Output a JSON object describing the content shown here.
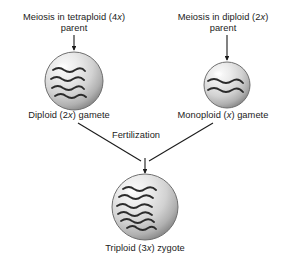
{
  "figure": {
    "background_color": "#ffffff",
    "text_color": "#1b1b1b",
    "cell_fill_light": "#f3f3f3",
    "cell_fill_mid": "#c9c9c9",
    "cell_fill_dark": "#8d8d8d",
    "cell_stroke": "#6e6e6e",
    "chromosome_color": "#2a2a2a",
    "arrow_color": "#1b1b1b"
  },
  "labels": {
    "tetraploid_parent_line1": "Meiosis in tetraploid (4",
    "tetraploid_parent_italic": "x",
    "tetraploid_parent_line1_end": ")",
    "tetraploid_parent_line2": "parent",
    "diploid_parent_line1": "Meiosis in diploid (2",
    "diploid_parent_italic": "x",
    "diploid_parent_line1_end": ")",
    "diploid_parent_line2": "parent",
    "diploid_gamete_pre": "Diploid (2",
    "diploid_gamete_italic": "x",
    "diploid_gamete_post": ") gamete",
    "monoploid_gamete_pre": "Monoploid (",
    "monoploid_gamete_italic": "x",
    "monoploid_gamete_post": ") gamete",
    "fertilization": "Fertilization",
    "triploid_zygote_pre": "Triploid (3",
    "triploid_zygote_italic": "x",
    "triploid_zygote_post": ") zygote"
  },
  "cells": [
    {
      "name": "diploid-gamete-cell",
      "cx": 74,
      "cy": 81,
      "r": 29,
      "chromosome_count": 4,
      "ploidy": "2x"
    },
    {
      "name": "monoploid-gamete-cell",
      "cx": 227,
      "cy": 85,
      "r": 23,
      "chromosome_count": 2,
      "ploidy": "x"
    },
    {
      "name": "triploid-zygote-cell",
      "cx": 145,
      "cy": 207,
      "r": 33,
      "chromosome_count": 6,
      "ploidy": "3x"
    }
  ],
  "arrows": [
    {
      "name": "meiosis-arrow-tetraploid",
      "x1": 74,
      "y1": 35,
      "x2": 74,
      "y2": 50
    },
    {
      "name": "meiosis-arrow-diploid",
      "x1": 227,
      "y1": 35,
      "x2": 227,
      "y2": 60
    },
    {
      "name": "fertilization-arrow-left",
      "x1": 78,
      "y1": 123,
      "x2": 143,
      "y2": 163
    },
    {
      "name": "fertilization-arrow-right",
      "x1": 213,
      "y1": 123,
      "x2": 147,
      "y2": 163
    },
    {
      "name": "fertilization-arrow-down",
      "x1": 145,
      "y1": 160,
      "x2": 145,
      "y2": 173
    }
  ]
}
